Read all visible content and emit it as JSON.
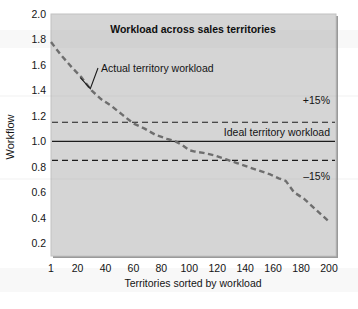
{
  "figure": {
    "name": "workload-across-sales-territories-chart",
    "background_color": "#ffffff",
    "plot_background_color": "#d5d5d5",
    "frame_color": "#8f8f8f",
    "series_color": "#6e6e6e",
    "reference_line_color": "#1c1c1c"
  },
  "chart_data": {
    "type": "line",
    "title": "Workload across sales territories",
    "xlabel": "Territories sorted by workload",
    "ylabel": "Workflow",
    "xlim": [
      1,
      205
    ],
    "ylim": [
      0.1,
      2.0
    ],
    "grid": false,
    "legend_position": "none",
    "xticks": [
      "1",
      "20",
      "40",
      "60",
      "80",
      "100",
      "120",
      "140",
      "160",
      "180",
      "200"
    ],
    "xtick_values": [
      1,
      20,
      40,
      60,
      80,
      100,
      120,
      140,
      160,
      180,
      200
    ],
    "yticks": [
      "0.2",
      "0.4",
      "0.6",
      "0.8",
      "1.0",
      "1.2",
      "1.4",
      "1.6",
      "1.8",
      "2.0"
    ],
    "ytick_values": [
      0.2,
      0.4,
      0.6,
      0.8,
      1.0,
      1.2,
      1.4,
      1.6,
      1.8,
      2.0
    ],
    "series": [
      {
        "name": "Actual territory workload",
        "style": "dashed",
        "x": [
          1,
          8,
          16,
          23,
          30,
          37,
          44,
          52,
          60,
          68,
          76,
          84,
          90,
          95,
          100,
          104,
          110,
          118,
          126,
          134,
          142,
          150,
          158,
          164,
          169,
          175,
          182,
          190,
          196,
          200
        ],
        "y": [
          1.78,
          1.68,
          1.58,
          1.5,
          1.4,
          1.33,
          1.28,
          1.21,
          1.14,
          1.1,
          1.05,
          1.02,
          1.0,
          0.97,
          0.93,
          0.92,
          0.91,
          0.89,
          0.86,
          0.83,
          0.8,
          0.77,
          0.74,
          0.71,
          0.69,
          0.6,
          0.55,
          0.47,
          0.41,
          0.37
        ]
      }
    ],
    "reference_lines": [
      {
        "name": "ideal-territory-workload",
        "value": 1.0,
        "style": "solid",
        "label": "Ideal territory workload"
      },
      {
        "name": "upper-tolerance",
        "value": 1.15,
        "style": "dashed",
        "label": "+15%"
      },
      {
        "name": "lower-tolerance",
        "value": 0.85,
        "style": "dashed",
        "label": "–15%"
      }
    ],
    "annotations": [
      {
        "name": "series-callout",
        "text": "Actual territory workload",
        "points_to_x": 22,
        "points_to_y": 1.5
      }
    ]
  }
}
